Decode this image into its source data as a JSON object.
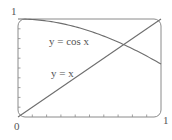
{
  "chart_data": {
    "type": "line",
    "title": "",
    "xlabel": "",
    "ylabel": "",
    "xlim": [
      0,
      1
    ],
    "ylim": [
      0,
      1
    ],
    "grid": false,
    "legend": null,
    "tick_labels": {
      "origin": "0",
      "x_max": "1",
      "y_max": "1"
    },
    "x_minor_ticks": 10,
    "y_minor_ticks": 10,
    "series": [
      {
        "name": "y = cos x",
        "x": [
          0,
          0.1,
          0.2,
          0.3,
          0.4,
          0.5,
          0.6,
          0.7,
          0.8,
          0.9,
          1.0
        ],
        "values": [
          1.0,
          0.995,
          0.98,
          0.955,
          0.921,
          0.878,
          0.825,
          0.765,
          0.697,
          0.622,
          0.54
        ]
      },
      {
        "name": "y = x",
        "x": [
          0,
          1
        ],
        "values": [
          0,
          1
        ]
      }
    ],
    "annotations": [
      {
        "text": "y = cos x",
        "x": 0.36,
        "y": 0.78
      },
      {
        "text": "y = x",
        "x": 0.36,
        "y": 0.42
      }
    ],
    "intersection": {
      "x": 0.739,
      "y": 0.739
    }
  },
  "labels": {
    "origin": "0",
    "x_max": "1",
    "y_max": "1",
    "cos_curve": "y = cos x",
    "line_curve": "y = x"
  },
  "colors": {
    "stroke": "#6e6e6e",
    "text": "#555555",
    "background": "#ffffff"
  }
}
